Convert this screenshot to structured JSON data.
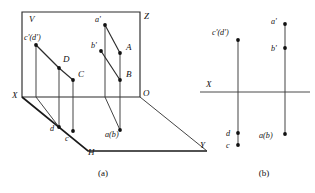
{
  "figure": {
    "panels": [
      {
        "id": "a",
        "caption": "(a)",
        "caption_pos": {
          "x": 103,
          "y": 176
        },
        "type": "pictorial-3d",
        "plane_labels": [
          {
            "name": "V",
            "text": "V",
            "x": 29,
            "y": 22
          },
          {
            "name": "Z",
            "text": "Z",
            "x": 144,
            "y": 19
          },
          {
            "name": "X",
            "text": "X",
            "x": 12,
            "y": 98
          },
          {
            "name": "O",
            "text": "O",
            "x": 143,
            "y": 96
          },
          {
            "name": "H",
            "text": "H",
            "x": 88,
            "y": 155
          },
          {
            "name": "Y",
            "text": "Y",
            "x": 200,
            "y": 148
          }
        ],
        "point_labels": [
          {
            "name": "c-prime-d-prime",
            "text": "c'(d')",
            "x": 24,
            "y": 40
          },
          {
            "name": "a-prime",
            "text": "a'",
            "x": 95,
            "y": 22
          },
          {
            "name": "b-prime",
            "text": "b'",
            "x": 91,
            "y": 48
          },
          {
            "name": "D",
            "text": "D",
            "x": 63,
            "y": 62
          },
          {
            "name": "C",
            "text": "C",
            "x": 78,
            "y": 77
          },
          {
            "name": "A",
            "text": "A",
            "x": 126,
            "y": 50
          },
          {
            "name": "B",
            "text": "B",
            "x": 126,
            "y": 77
          },
          {
            "name": "d",
            "text": "d",
            "x": 50,
            "y": 131
          },
          {
            "name": "c",
            "text": "c",
            "x": 65,
            "y": 141
          },
          {
            "name": "a-b",
            "text": "a(b)",
            "x": 105,
            "y": 137
          }
        ],
        "points": [
          {
            "name": "cd-prime-dot",
            "x": 36,
            "y": 45
          },
          {
            "name": "a-prime-dot",
            "x": 105,
            "y": 25
          },
          {
            "name": "b-prime-dot",
            "x": 101,
            "y": 51
          },
          {
            "name": "D-dot",
            "x": 59,
            "y": 68
          },
          {
            "name": "C-dot",
            "x": 73,
            "y": 80
          },
          {
            "name": "A-dot",
            "x": 120,
            "y": 53
          },
          {
            "name": "B-dot",
            "x": 120,
            "y": 80
          },
          {
            "name": "d-dot",
            "x": 59,
            "y": 127
          },
          {
            "name": "c-dot",
            "x": 73,
            "y": 131
          },
          {
            "name": "ab-dot",
            "x": 120,
            "y": 130
          }
        ]
      },
      {
        "id": "b",
        "caption": "(b)",
        "caption_pos": {
          "x": 264,
          "y": 176
        },
        "type": "orthographic-2d",
        "axis_label": {
          "name": "X",
          "text": "X",
          "x": 206,
          "y": 87
        },
        "axis_line": {
          "x1": 200,
          "y1": 92,
          "x2": 310,
          "y2": 92
        },
        "point_labels": [
          {
            "name": "c-prime-d-prime",
            "text": "c'(d')",
            "x": 212,
            "y": 35
          },
          {
            "name": "a-prime",
            "text": "a'",
            "x": 271,
            "y": 24
          },
          {
            "name": "b-prime",
            "text": "b'",
            "x": 271,
            "y": 51
          },
          {
            "name": "d",
            "text": "d",
            "x": 226,
            "y": 136
          },
          {
            "name": "c",
            "text": "c",
            "x": 226,
            "y": 148
          },
          {
            "name": "a-b",
            "text": "a(b)",
            "x": 259,
            "y": 138
          }
        ],
        "points": [
          {
            "name": "cd-prime-dot",
            "x": 238,
            "y": 40
          },
          {
            "name": "a-prime-dot",
            "x": 285,
            "y": 24
          },
          {
            "name": "b-prime-dot",
            "x": 285,
            "y": 48
          },
          {
            "name": "d-dot",
            "x": 238,
            "y": 133
          },
          {
            "name": "c-dot",
            "x": 238,
            "y": 145
          },
          {
            "name": "ab-dot",
            "x": 285,
            "y": 134
          }
        ]
      }
    ]
  }
}
